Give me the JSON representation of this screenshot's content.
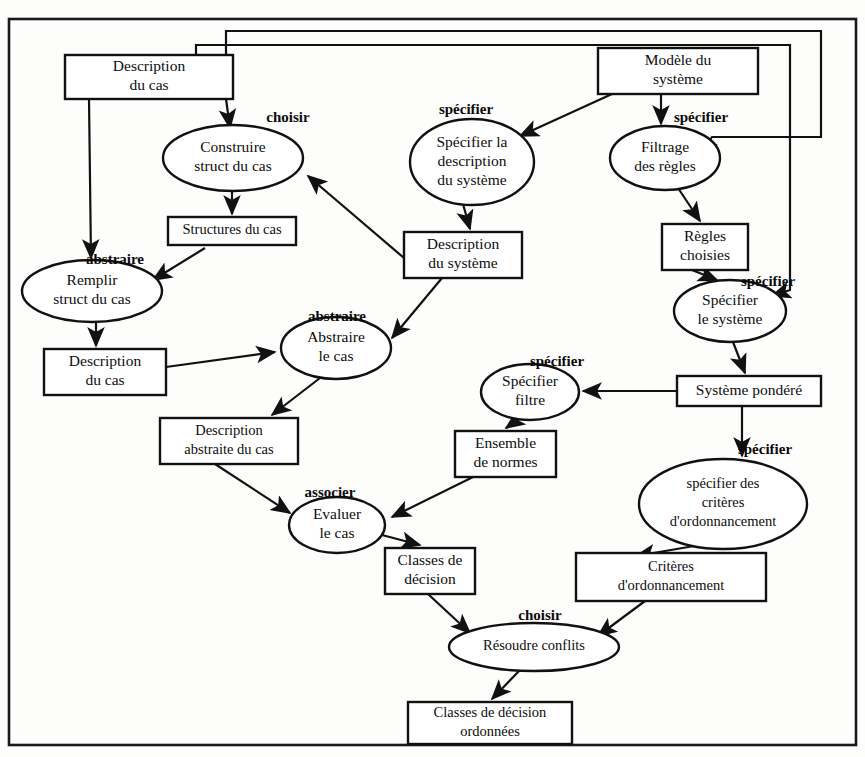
{
  "diagram": {
    "language": "fr",
    "frame": {
      "stroke": "#1a1a1a"
    },
    "colors": {
      "line": "#111111",
      "fill": "#ffffff",
      "background": "#fdfdfc"
    },
    "nodes": [
      {
        "id": "description-du-cas-top",
        "shape": "box",
        "lines": [
          "Description",
          "du cas"
        ],
        "x": 65,
        "y": 55,
        "w": 168,
        "h": 44
      },
      {
        "id": "modele-du-systeme",
        "shape": "box",
        "lines": [
          "Modèle du",
          "système"
        ],
        "x": 598,
        "y": 48,
        "w": 160,
        "h": 46
      },
      {
        "id": "construire-struct-du-cas",
        "shape": "ellipse",
        "lines": [
          "Construire",
          "struct du cas"
        ],
        "cx": 233,
        "cy": 158,
        "rx": 70,
        "ry": 33
      },
      {
        "id": "specifier-la-description-du-systeme",
        "shape": "ellipse",
        "lines": [
          "Spécifier la",
          "description",
          "du système"
        ],
        "cx": 472,
        "cy": 162,
        "rx": 62,
        "ry": 43
      },
      {
        "id": "filtrage-des-regles",
        "shape": "ellipse",
        "lines": [
          "Filtrage",
          "des règles"
        ],
        "cx": 665,
        "cy": 158,
        "rx": 55,
        "ry": 32
      },
      {
        "id": "structures-du-cas",
        "shape": "box",
        "lines": [
          "Structures du cas"
        ],
        "x": 168,
        "y": 217,
        "w": 128,
        "h": 28
      },
      {
        "id": "description-du-systeme",
        "shape": "box",
        "lines": [
          "Description",
          "du système"
        ],
        "x": 404,
        "y": 232,
        "w": 118,
        "h": 46
      },
      {
        "id": "regles-choisies",
        "shape": "box",
        "lines": [
          "Règles",
          "choisies"
        ],
        "x": 662,
        "y": 224,
        "w": 86,
        "h": 46
      },
      {
        "id": "remplir-struct-du-cas",
        "shape": "ellipse",
        "lines": [
          "Remplir",
          "struct du cas"
        ],
        "cx": 92,
        "cy": 291,
        "rx": 70,
        "ry": 31
      },
      {
        "id": "abstraire-le-cas",
        "shape": "ellipse",
        "lines": [
          "Abstraire",
          "le  cas"
        ],
        "cx": 336,
        "cy": 348,
        "rx": 55,
        "ry": 31
      },
      {
        "id": "specifier-le-systeme",
        "shape": "ellipse",
        "lines": [
          "Spécifier",
          "le système"
        ],
        "cx": 730,
        "cy": 311,
        "rx": 56,
        "ry": 31
      },
      {
        "id": "description-du-cas-left",
        "shape": "box",
        "lines": [
          "Description",
          "du cas"
        ],
        "x": 44,
        "y": 349,
        "w": 122,
        "h": 46
      },
      {
        "id": "specifier-filtre",
        "shape": "ellipse",
        "lines": [
          "Spécifier",
          "filtre"
        ],
        "cx": 530,
        "cy": 392,
        "rx": 49,
        "ry": 28
      },
      {
        "id": "systeme-pondere",
        "shape": "box",
        "lines": [
          "Système pondéré"
        ],
        "x": 677,
        "y": 376,
        "w": 144,
        "h": 30
      },
      {
        "id": "description-abstraite-du-cas",
        "shape": "box",
        "lines": [
          "Description",
          "abstraite du cas"
        ],
        "x": 160,
        "y": 418,
        "w": 138,
        "h": 46
      },
      {
        "id": "ensemble-de-normes",
        "shape": "box",
        "lines": [
          "Ensemble",
          "de normes"
        ],
        "x": 455,
        "y": 431,
        "w": 101,
        "h": 46
      },
      {
        "id": "specifier-des-criteres-d-ordonnancement",
        "shape": "ellipse",
        "lines": [
          "spécifier des",
          "critères",
          "d'ordonnancement"
        ],
        "cx": 723,
        "cy": 504,
        "rx": 84,
        "ry": 45
      },
      {
        "id": "evaluer-le-cas",
        "shape": "ellipse",
        "lines": [
          "Evaluer",
          "le  cas"
        ],
        "cx": 337,
        "cy": 525,
        "rx": 48,
        "ry": 28
      },
      {
        "id": "classes-de-decision",
        "shape": "box",
        "lines": [
          "Classes de",
          "décision"
        ],
        "x": 385,
        "y": 548,
        "w": 90,
        "h": 46
      },
      {
        "id": "criteres-d-ordonnancement",
        "shape": "box",
        "lines": [
          "Critères",
          "d'ordonnancement"
        ],
        "x": 576,
        "y": 553,
        "w": 190,
        "h": 48
      },
      {
        "id": "resoudre-conflits",
        "shape": "ellipse",
        "lines": [
          "Résoudre conflits"
        ],
        "cx": 534,
        "cy": 647,
        "rx": 85,
        "ry": 24
      },
      {
        "id": "classes-de-decision-ordonnees",
        "shape": "box",
        "lines": [
          "Classes de décision",
          "ordonnées"
        ],
        "x": 408,
        "y": 702,
        "w": 164,
        "h": 42
      }
    ],
    "verb_labels": [
      {
        "id": "choisir-construire",
        "text": "choisir",
        "x": 288,
        "y": 119
      },
      {
        "id": "specifier-description",
        "text": "spécifier",
        "x": 466,
        "y": 111
      },
      {
        "id": "specifier-filtrage",
        "text": "spécifier",
        "x": 701,
        "y": 119
      },
      {
        "id": "abstraire-remplir",
        "text": "abstraire",
        "x": 115,
        "y": 261
      },
      {
        "id": "abstraire-abstraire",
        "text": "abstraire",
        "x": 337,
        "y": 318
      },
      {
        "id": "specifier-systeme",
        "text": "spécifier",
        "x": 768,
        "y": 283
      },
      {
        "id": "specifier-filtre-label",
        "text": "spécifier",
        "x": 557,
        "y": 363
      },
      {
        "id": "specifier-criteres",
        "text": "spécifier",
        "x": 765,
        "y": 451
      },
      {
        "id": "associer-evaluer",
        "text": "associer",
        "x": 330,
        "y": 494
      },
      {
        "id": "choisir-resoudre",
        "text": "choisir",
        "x": 540,
        "y": 617
      }
    ],
    "edges": [
      {
        "from": "description-du-cas-top",
        "to": "construire-struct-du-cas",
        "kind": "arrow"
      },
      {
        "from": "description-du-cas-top",
        "to": "remplir-struct-du-cas",
        "kind": "arrow"
      },
      {
        "from": "description-du-cas-top",
        "to": "filtrage-des-regles",
        "kind": "routed-arrow"
      },
      {
        "from": "description-du-cas-top",
        "to": "specifier-le-systeme",
        "kind": "routed-arrow"
      },
      {
        "from": "construire-struct-du-cas",
        "to": "structures-du-cas",
        "kind": "arrow"
      },
      {
        "from": "structures-du-cas",
        "to": "remplir-struct-du-cas",
        "kind": "arrow"
      },
      {
        "from": "remplir-struct-du-cas",
        "to": "description-du-cas-left",
        "kind": "arrow"
      },
      {
        "from": "description-du-cas-left",
        "to": "abstraire-le-cas",
        "kind": "arrow"
      },
      {
        "from": "modele-du-systeme",
        "to": "specifier-la-description-du-systeme",
        "kind": "arrow"
      },
      {
        "from": "modele-du-systeme",
        "to": "filtrage-des-regles",
        "kind": "arrow"
      },
      {
        "from": "specifier-la-description-du-systeme",
        "to": "description-du-systeme",
        "kind": "arrow"
      },
      {
        "from": "description-du-systeme",
        "to": "construire-struct-du-cas",
        "kind": "arrow"
      },
      {
        "from": "description-du-systeme",
        "to": "abstraire-le-cas",
        "kind": "arrow"
      },
      {
        "from": "filtrage-des-regles",
        "to": "regles-choisies",
        "kind": "arrow"
      },
      {
        "from": "regles-choisies",
        "to": "specifier-le-systeme",
        "kind": "arrow"
      },
      {
        "from": "specifier-le-systeme",
        "to": "systeme-pondere",
        "kind": "arrow"
      },
      {
        "from": "systeme-pondere",
        "to": "specifier-filtre",
        "kind": "arrow"
      },
      {
        "from": "systeme-pondere",
        "to": "specifier-des-criteres-d-ordonnancement",
        "kind": "arrow"
      },
      {
        "from": "specifier-filtre",
        "to": "ensemble-de-normes",
        "kind": "arrow"
      },
      {
        "from": "ensemble-de-normes",
        "to": "evaluer-le-cas",
        "kind": "arrow"
      },
      {
        "from": "abstraire-le-cas",
        "to": "description-abstraite-du-cas",
        "kind": "arrow"
      },
      {
        "from": "description-abstraite-du-cas",
        "to": "evaluer-le-cas",
        "kind": "arrow"
      },
      {
        "from": "evaluer-le-cas",
        "to": "classes-de-decision",
        "kind": "arrow"
      },
      {
        "from": "specifier-des-criteres-d-ordonnancement",
        "to": "criteres-d-ordonnancement",
        "kind": "arrow"
      },
      {
        "from": "classes-de-decision",
        "to": "resoudre-conflits",
        "kind": "arrow"
      },
      {
        "from": "criteres-d-ordonnancement",
        "to": "resoudre-conflits",
        "kind": "arrow"
      },
      {
        "from": "resoudre-conflits",
        "to": "classes-de-decision-ordonnees",
        "kind": "arrow"
      }
    ]
  }
}
